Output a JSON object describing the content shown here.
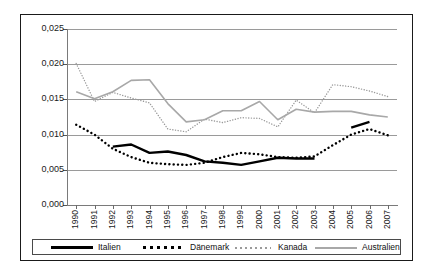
{
  "chart_data": {
    "type": "line",
    "title": "",
    "subtitle": "",
    "xlabel": "",
    "ylabel": "",
    "grid": true,
    "legend_position": "bottom",
    "ylim": [
      0.0,
      0.025
    ],
    "ytick_labels": [
      "0,025",
      "0,020",
      "0,015",
      "0,010",
      "0,005",
      "0,000"
    ],
    "ytick_values": [
      0.025,
      0.02,
      0.015,
      0.01,
      0.005,
      0.0
    ],
    "categories": [
      "1990",
      "1991",
      "1992",
      "1993",
      "1994",
      "1995",
      "1996",
      "1997",
      "1998",
      "1999",
      "2000",
      "2001",
      "2002",
      "2003",
      "2004",
      "2005",
      "2006",
      "2007"
    ],
    "series": [
      {
        "name": "Italien",
        "style": "solid-thick-black",
        "color": "#000000",
        "values": [
          null,
          null,
          0.0083,
          0.0086,
          0.0074,
          0.0076,
          0.0071,
          0.0062,
          0.006,
          0.0057,
          0.0062,
          0.0067,
          0.0066,
          0.0066,
          null,
          0.011,
          0.0118,
          null
        ]
      },
      {
        "name": "Dänemark",
        "style": "dotted-thick-black",
        "color": "#000000",
        "values": [
          0.0114,
          0.01,
          0.008,
          0.0068,
          0.006,
          0.0058,
          0.0057,
          0.006,
          0.0068,
          0.0074,
          0.0072,
          0.0068,
          0.0067,
          0.0069,
          0.0085,
          0.01,
          0.0108,
          0.0099
        ]
      },
      {
        "name": "Kanada",
        "style": "dotted-fine-gray",
        "color": "#9a9a9a",
        "values": [
          0.0201,
          0.0147,
          0.016,
          0.0152,
          0.0145,
          0.0108,
          0.0104,
          0.0122,
          0.0117,
          0.0124,
          0.0123,
          0.0111,
          0.0149,
          0.0131,
          0.0171,
          0.0168,
          0.0162,
          0.0154
        ]
      },
      {
        "name": "Australien",
        "style": "solid-gray",
        "color": "#a8a8a8",
        "values": [
          0.0161,
          0.0151,
          0.0161,
          0.0177,
          0.0178,
          0.0144,
          0.0118,
          0.0121,
          0.0134,
          0.0134,
          0.0147,
          0.0121,
          0.0136,
          0.0132,
          0.0133,
          0.0133,
          0.0128,
          0.0125
        ]
      }
    ]
  },
  "legend": {
    "items": [
      {
        "label": "Italien"
      },
      {
        "label": "Dänemark"
      },
      {
        "label": "Kanada"
      },
      {
        "label": "Australien"
      }
    ]
  }
}
